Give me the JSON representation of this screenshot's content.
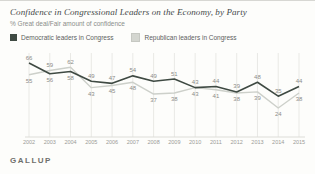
{
  "header": {
    "title": "Confidence in Congressional Leaders on the Economy, by Party",
    "subtitle": "% Great deal/Fair amount of confidence"
  },
  "legend": [
    {
      "label": "Democratic leaders in Congress",
      "color": "#3f4a43"
    },
    {
      "label": "Republican leaders in Congress",
      "color": "#d4d6d0"
    }
  ],
  "footer": {
    "brand": "GALLUP"
  },
  "colors": {
    "grid": "#e9e9e5",
    "axis_text": "#9b9b97",
    "value_label": "#8c8c88",
    "dem_line": "#3f4a43",
    "rep_line": "#cdd0ca"
  },
  "chart_data": {
    "type": "line",
    "title": "Confidence in Congressional Leaders on the Economy, by Party",
    "subtitle": "% Great deal/Fair amount of confidence",
    "x": [
      2002,
      2003,
      2004,
      2005,
      2006,
      2007,
      2008,
      2009,
      2010,
      2011,
      2012,
      2013,
      2014,
      2015
    ],
    "series": [
      {
        "name": "Democratic leaders in Congress",
        "values": [
          66,
          56,
          58,
          49,
          47,
          54,
          49,
          51,
          43,
          44,
          39,
          48,
          35,
          44
        ]
      },
      {
        "name": "Republican leaders in Congress",
        "values": [
          55,
          59,
          62,
          43,
          45,
          48,
          37,
          38,
          43,
          41,
          38,
          39,
          24,
          38
        ]
      }
    ],
    "ylim": [
      20,
      70
    ],
    "xlabel": "",
    "ylabel": "",
    "grid": "vertical-yearly",
    "legend_position": "top",
    "data_labels": true
  }
}
